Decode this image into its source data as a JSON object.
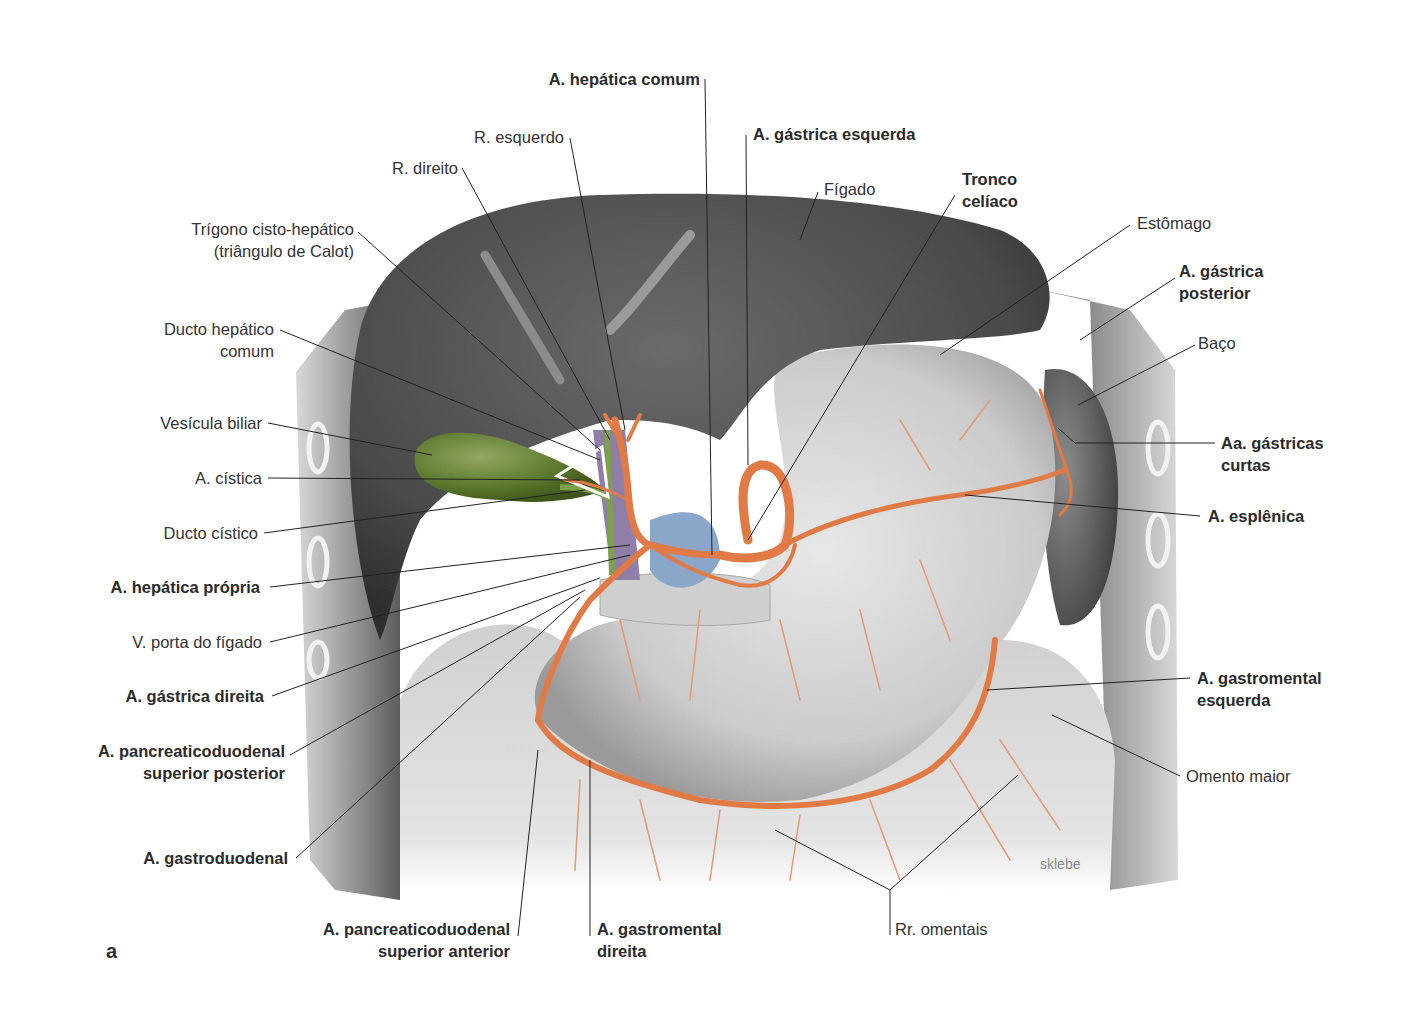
{
  "figure": {
    "panel_letter": "a",
    "signature": "sklebe",
    "colors": {
      "artery": "#e27a45",
      "artery_dark": "#c85a2a",
      "liver": "#4a4a4a",
      "stomach": "#cfcfcf",
      "gallbladder": "#5d7a2e",
      "bile_duct": "#7fa04a",
      "portal_vein": "#8e7ea8",
      "vein_blue": "#8aa6c8",
      "omentum": "#dedede",
      "body_wall": "#9a9a9a",
      "leader_line": "#222222"
    }
  },
  "labels": {
    "hepatica_comum": {
      "text": [
        "A. hepática comum"
      ],
      "bold": true
    },
    "r_esquerdo": {
      "text": [
        "R. esquerdo"
      ],
      "bold": false
    },
    "gastrica_esquerda": {
      "text": [
        "A. gástrica esquerda"
      ],
      "bold": true
    },
    "r_direito": {
      "text": [
        "R. direito"
      ],
      "bold": false
    },
    "figado": {
      "text": [
        "Fígado"
      ],
      "bold": false
    },
    "tronco_celiaco": {
      "text": [
        "Tronco",
        "celíaco"
      ],
      "bold": true
    },
    "estomago": {
      "text": [
        "Estômago"
      ],
      "bold": false
    },
    "trigono": {
      "text": [
        "Trígono cisto-hepático",
        "(triângulo de Calot)"
      ],
      "bold": false
    },
    "gastrica_posterior": {
      "text": [
        "A. gástrica",
        "posterior"
      ],
      "bold": true
    },
    "ducto_hepatico_comum": {
      "text": [
        "Ducto hepático",
        "comum"
      ],
      "bold": false
    },
    "baco": {
      "text": [
        "Baço"
      ],
      "bold": false
    },
    "vesicula_biliar": {
      "text": [
        "Vesícula biliar"
      ],
      "bold": false
    },
    "gastricas_curtas": {
      "text": [
        "Aa. gástricas",
        "curtas"
      ],
      "bold": true
    },
    "cistica": {
      "text": [
        "A. cística"
      ],
      "bold": false
    },
    "esplenica": {
      "text": [
        "A. esplênica"
      ],
      "bold": true
    },
    "ducto_cistico": {
      "text": [
        "Ducto cístico"
      ],
      "bold": false
    },
    "hepatica_propria": {
      "text": [
        "A. hepática própria"
      ],
      "bold": true
    },
    "v_porta": {
      "text": [
        "V. porta do fígado"
      ],
      "bold": false
    },
    "gastrica_direita": {
      "text": [
        "A. gástrica direita"
      ],
      "bold": true
    },
    "gastromental_esquerda": {
      "text": [
        "A. gastromental",
        "esquerda"
      ],
      "bold": true
    },
    "pancreatico_post": {
      "text": [
        "A. pancreaticoduodenal",
        "superior posterior"
      ],
      "bold": true
    },
    "omento_maior": {
      "text": [
        "Omento maior"
      ],
      "bold": false
    },
    "gastroduodenal": {
      "text": [
        "A. gastroduodenal"
      ],
      "bold": true
    },
    "pancreatico_ant": {
      "text": [
        "A. pancreaticoduodenal",
        "superior anterior"
      ],
      "bold": true
    },
    "gastromental_direita": {
      "text": [
        "A. gastromental",
        "direita"
      ],
      "bold": true
    },
    "rr_omentais": {
      "text": [
        "Rr. omentais"
      ],
      "bold": false
    }
  }
}
